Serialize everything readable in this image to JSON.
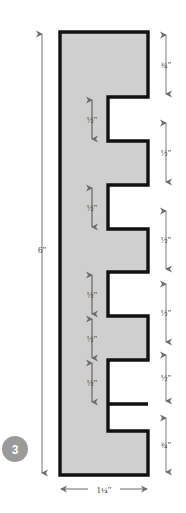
{
  "figure": {
    "step_badge": "3",
    "colors": {
      "background": "#ffffff",
      "board_fill": "#cfcfcf",
      "board_outline": "#111111",
      "dimension_line": "#6e6e6e",
      "dimension_text": "#3c3c3c",
      "badge_fill": "#9a9a9a",
      "badge_text": "#ffffff"
    }
  },
  "dimensions": {
    "overall_height": "6\"",
    "overall_width": "1¼\"",
    "right_segments": [
      {
        "label": "¾\"",
        "kind": "tab"
      },
      {
        "label": "½\"",
        "kind": "tab"
      },
      {
        "label": "½\"",
        "kind": "tab"
      },
      {
        "label": "½\"",
        "kind": "tab"
      },
      {
        "label": "½\"",
        "kind": "tab"
      },
      {
        "label": "¾\"",
        "kind": "tab"
      }
    ],
    "notch_labels": [
      {
        "label": "½\""
      },
      {
        "label": "½\""
      },
      {
        "label": "½\""
      },
      {
        "label": "½\""
      },
      {
        "label": "½\""
      }
    ]
  },
  "geometry": {
    "board_left": 60,
    "board_right": 148,
    "board_top": 32,
    "board_bottom": 475,
    "notch_inner_x": 108,
    "tabs": [
      {
        "top": 32,
        "bottom": 97
      },
      {
        "top": 141,
        "bottom": 185
      },
      {
        "top": 229,
        "bottom": 272
      },
      {
        "top": 316,
        "bottom": 360
      },
      {
        "top": 404,
        "bottom": 431
      },
      {
        "top": 431,
        "bottom": 475
      }
    ],
    "notches": [
      {
        "top": 97,
        "bottom": 141
      },
      {
        "top": 185,
        "bottom": 229
      },
      {
        "top": 272,
        "bottom": 316
      },
      {
        "top": 360,
        "bottom": 404
      },
      {
        "top": 404,
        "bottom": 431
      }
    ]
  }
}
